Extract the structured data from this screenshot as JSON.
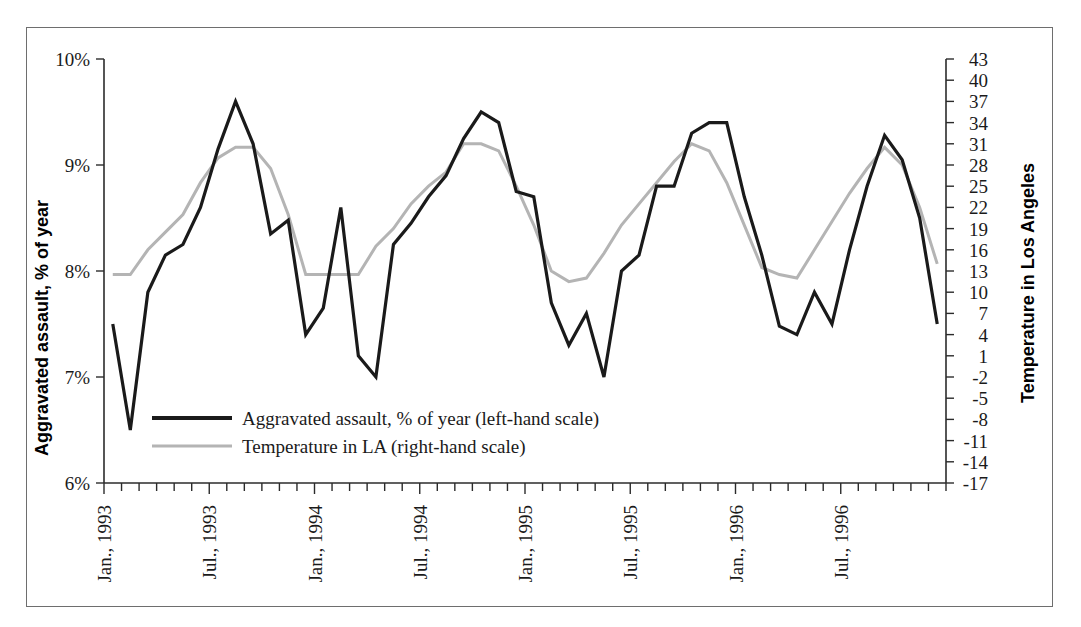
{
  "chart_data": {
    "type": "line",
    "title": "",
    "subtitle": "",
    "xlabel": "",
    "ylabel": "Aggravated assault, % of year",
    "y2label": "Temperature in Los Angeles",
    "grid": false,
    "legend_position": "inside-lower-left",
    "ylim": [
      6,
      10
    ],
    "y_ticks": [
      "6%",
      "7%",
      "8%",
      "9%",
      "10%"
    ],
    "y_tick_values": [
      6,
      7,
      8,
      9,
      10
    ],
    "y2lim": [
      -17,
      43
    ],
    "y2_ticks": [
      "43",
      "40",
      "37",
      "34",
      "31",
      "28",
      "25",
      "22",
      "19",
      "16",
      "13",
      "10",
      "7",
      "4",
      "1",
      "-2",
      "-5",
      "-8",
      "-11",
      "-14",
      "-17"
    ],
    "y2_tick_values": [
      43,
      40,
      37,
      34,
      31,
      28,
      25,
      22,
      19,
      16,
      13,
      10,
      7,
      4,
      1,
      -2,
      -5,
      -8,
      -11,
      -14,
      -17
    ],
    "x_tick_labels": [
      "Jan., 1993",
      "Jul., 1993",
      "Jan., 1994",
      "Jul., 1994",
      "Jan., 1995",
      "Jul., 1995",
      "Jan., 1996",
      "Jul., 1996"
    ],
    "x_tick_indices": [
      0,
      6,
      12,
      18,
      24,
      30,
      36,
      42
    ],
    "x_count": 48,
    "series": [
      {
        "name": "Aggravated assault, % of year (left-hand scale)",
        "axis": "left",
        "color": "#1a1a1a",
        "width": 3.2,
        "values": [
          7.5,
          6.5,
          7.8,
          8.15,
          8.25,
          8.6,
          9.15,
          9.6,
          9.2,
          8.35,
          8.48,
          7.4,
          7.65,
          8.6,
          7.2,
          7.0,
          8.25,
          8.45,
          8.7,
          8.9,
          9.25,
          9.5,
          9.4,
          8.75,
          8.7,
          7.7,
          7.3,
          7.6,
          7.0,
          8.0,
          8.15,
          8.8,
          8.8,
          9.3,
          9.4,
          9.4,
          8.7,
          8.15,
          7.48,
          7.4,
          7.8,
          7.5,
          8.2,
          8.8,
          9.28,
          9.05,
          8.5,
          7.5
        ]
      },
      {
        "name": "Temperature in LA (right-hand scale)",
        "axis": "right",
        "color": "#b4b4b4",
        "width": 3.0,
        "values": [
          12.5,
          12.5,
          16.0,
          18.5,
          21.0,
          25.5,
          29.0,
          30.5,
          30.5,
          27.5,
          21.0,
          12.5,
          12.5,
          12.5,
          12.5,
          16.5,
          19.0,
          22.5,
          25.0,
          27.0,
          31.0,
          31.0,
          30.0,
          25.0,
          19.5,
          13.0,
          11.5,
          12.0,
          15.5,
          19.5,
          22.5,
          25.5,
          28.5,
          31.0,
          30.0,
          25.5,
          19.5,
          13.5,
          12.5,
          12.0,
          16.0,
          20.0,
          24.0,
          27.5,
          30.5,
          28.0,
          22.0,
          14.0
        ]
      }
    ]
  },
  "legend": {
    "items": [
      {
        "label": "Aggravated assault, % of year (left-hand scale)",
        "color": "#1a1a1a"
      },
      {
        "label": "Temperature in LA (right-hand scale)",
        "color": "#b4b4b4"
      }
    ]
  },
  "axes": {
    "left_title": "Aggravated assault, % of year",
    "right_title": "Temperature in Los Angeles"
  }
}
